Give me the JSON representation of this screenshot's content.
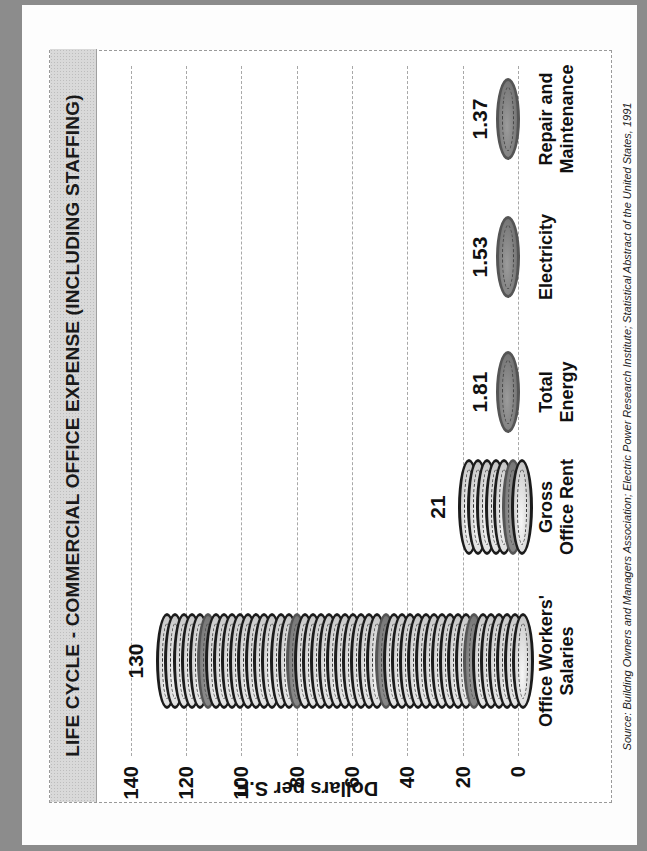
{
  "chart_data": {
    "type": "bar",
    "title": "LIFE CYCLE - COMMERCIAL OFFICE EXPENSE (INCLUDING STAFFING)",
    "xlabel": "",
    "ylabel": "Dollars per S.F.",
    "ylim": [
      0,
      140
    ],
    "yticks": [
      0,
      20,
      40,
      60,
      80,
      100,
      120,
      140
    ],
    "grid": true,
    "orientation": "vertical (page rotated 90° counter-clockwise)",
    "bar_style": "stacked coins pictograph",
    "categories": [
      "Office Workers' Salaries",
      "Gross Office Rent",
      "Total Energy",
      "Electricity",
      "Repair and Maintenance"
    ],
    "values": [
      130,
      21,
      1.81,
      1.53,
      1.37
    ],
    "data_labels": [
      "130",
      "21",
      "1.81",
      "1.53",
      "1.37"
    ],
    "source": "Source: Building Owners and Managers Association; Electric Power Research Institute; Statistical Abstract of the United States, 1991"
  },
  "chart": {
    "title": "LIFE CYCLE - COMMERCIAL OFFICE EXPENSE (INCLUDING STAFFING)",
    "axis_title": "Dollars per S.F.",
    "ticks": [
      "0",
      "20",
      "40",
      "60",
      "80",
      "100",
      "120",
      "140"
    ],
    "categories": [
      {
        "line1": "Office Workers'",
        "line2": "Salaries",
        "value": "130"
      },
      {
        "line1": "Gross",
        "line2": "Office Rent",
        "value": "21"
      },
      {
        "line1": "Total",
        "line2": "Energy",
        "value": "1.81"
      },
      {
        "line1": "Electricity",
        "line2": "",
        "value": "1.53"
      },
      {
        "line1": "Repair and",
        "line2": "Maintenance",
        "value": "1.37"
      }
    ],
    "source": "Source: Building Owners and Managers Association; Electric Power Research Institute; Statistical Abstract of the United States, 1991"
  },
  "colors": {
    "frame": "#8c8c8c",
    "title_band": "#d9d9d9",
    "coin_light": "#d6d6d6",
    "coin_dark": "#7d7d7d",
    "coin_rim": "#1c1c1c"
  }
}
